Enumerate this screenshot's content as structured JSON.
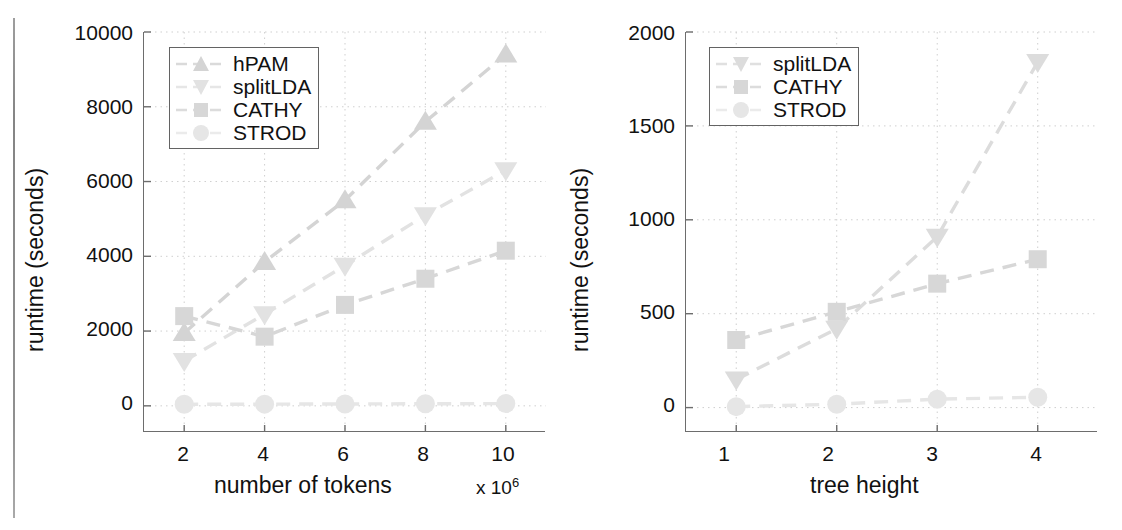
{
  "figures": [
    {
      "id": "left",
      "legend": {
        "entries": [
          {
            "label": "hPAM",
            "marker": "triangle-up",
            "color": "#d4d4d4"
          },
          {
            "label": "splitLDA",
            "marker": "triangle-down",
            "color": "#e2e2e2"
          },
          {
            "label": "CATHY",
            "marker": "square",
            "color": "#d7d7d7"
          },
          {
            "label": "STROD",
            "marker": "circle",
            "color": "#e6e6e6"
          }
        ]
      },
      "axes": {
        "yticks": [
          "0",
          "2000",
          "4000",
          "6000",
          "8000",
          "10000"
        ],
        "xticks": [
          "2",
          "4",
          "6",
          "8",
          "10"
        ],
        "xlabel": "number of tokens",
        "ylabel": "runtime (seconds)",
        "x_multiplier": "x 10",
        "x_multiplier_exp": "6"
      },
      "chart_data": {
        "type": "line",
        "title": "",
        "xlabel": "number of tokens",
        "ylabel": "runtime (seconds)",
        "x_multiplier": "x 10^6",
        "x": [
          2,
          4,
          6,
          8,
          10
        ],
        "xlim": [
          1,
          11
        ],
        "ylim": [
          -700,
          10000
        ],
        "grid": true,
        "legend_position": "top-left",
        "series": [
          {
            "name": "hPAM",
            "marker": "triangle-up",
            "values": [
              1950,
              3850,
              5500,
              7600,
              9400
            ]
          },
          {
            "name": "splitLDA",
            "marker": "triangle-down",
            "values": [
              1200,
              2450,
              3750,
              5100,
              6300
            ]
          },
          {
            "name": "CATHY",
            "marker": "square",
            "values": [
              2400,
              1850,
              2700,
              3400,
              4150
            ]
          },
          {
            "name": "STROD",
            "marker": "circle",
            "values": [
              40,
              45,
              50,
              55,
              60
            ]
          }
        ]
      }
    },
    {
      "id": "right",
      "legend": {
        "entries": [
          {
            "label": "splitLDA",
            "marker": "triangle-down",
            "color": "#dcdcdc"
          },
          {
            "label": "CATHY",
            "marker": "square",
            "color": "#d7d7d7"
          },
          {
            "label": "STROD",
            "marker": "circle",
            "color": "#e6e6e6"
          }
        ]
      },
      "axes": {
        "yticks": [
          "0",
          "500",
          "1000",
          "1500",
          "2000"
        ],
        "xticks": [
          "1",
          "2",
          "3",
          "4"
        ],
        "xlabel": "tree height",
        "ylabel": "runtime (seconds)",
        "x_multiplier": "",
        "x_multiplier_exp": ""
      },
      "chart_data": {
        "type": "line",
        "title": "",
        "xlabel": "tree height",
        "ylabel": "runtime (seconds)",
        "x": [
          1,
          2,
          3,
          4
        ],
        "xlim": [
          0.5,
          4.6
        ],
        "ylim": [
          -130,
          2000
        ],
        "grid": true,
        "legend_position": "top-left",
        "series": [
          {
            "name": "splitLDA",
            "marker": "triangle-down",
            "values": [
              150,
              420,
              910,
              1840
            ]
          },
          {
            "name": "CATHY",
            "marker": "square",
            "values": [
              360,
              510,
              660,
              790
            ]
          },
          {
            "name": "STROD",
            "marker": "circle",
            "values": [
              5,
              18,
              45,
              55
            ]
          }
        ]
      }
    }
  ]
}
